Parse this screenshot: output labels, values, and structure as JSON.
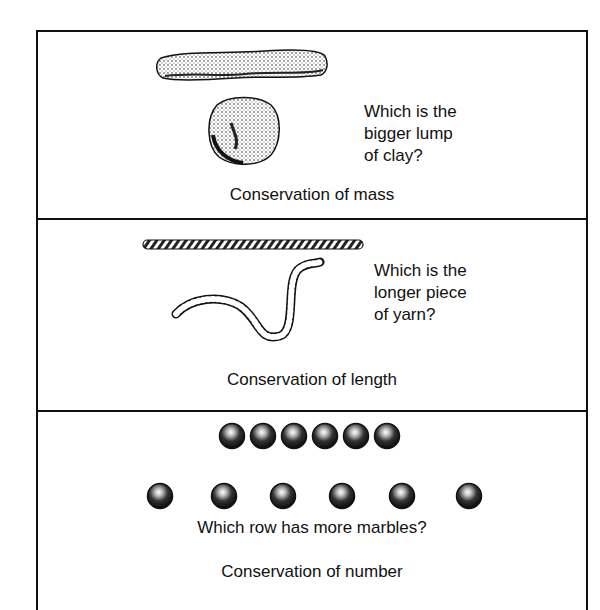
{
  "panels": [
    {
      "id": "mass",
      "illustration": [
        "clay-log",
        "clay-ball"
      ],
      "question_lines": [
        "Which is the",
        "bigger lump",
        "of clay?"
      ],
      "caption": "Conservation of mass"
    },
    {
      "id": "length",
      "illustration": [
        "straight-yarn",
        "curved-yarn"
      ],
      "question_lines": [
        "Which is the",
        "longer piece",
        "of yarn?"
      ],
      "caption": "Conservation of length"
    },
    {
      "id": "number",
      "illustration": [
        "marble-row-compact",
        "marble-row-spread"
      ],
      "marbles_per_row": [
        6,
        6
      ],
      "question": "Which row has more marbles?",
      "caption": "Conservation of number"
    }
  ],
  "colors": {
    "ink": "#111111",
    "paper": "#ffffff"
  }
}
